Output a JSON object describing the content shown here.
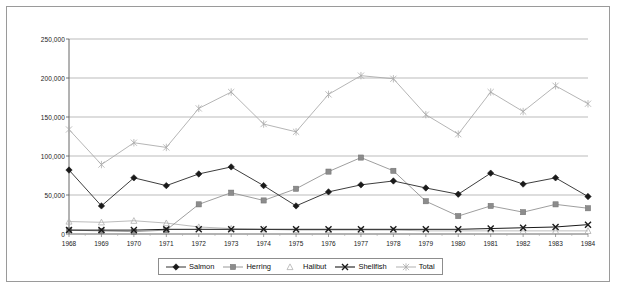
{
  "chart_data": {
    "type": "line",
    "title": "",
    "xlabel": "",
    "ylabel": "",
    "grid": true,
    "legend_position": "bottom",
    "ylim": [
      0,
      250000
    ],
    "ytick_labels": [
      "250,000",
      "200,000",
      "150,000",
      "100,000",
      "50,000",
      "0"
    ],
    "yticks": [
      250000,
      200000,
      150000,
      100000,
      50000,
      0
    ],
    "categories": [
      "1968",
      "1969",
      "1970",
      "1971",
      "1972",
      "1973",
      "1974",
      "1975",
      "1976",
      "1977",
      "1978",
      "1979",
      "1980",
      "1981",
      "1982",
      "1983",
      "1984"
    ],
    "x": [
      1968,
      1969,
      1970,
      1971,
      1972,
      1973,
      1974,
      1975,
      1976,
      1977,
      1978,
      1979,
      1980,
      1981,
      1982,
      1983,
      1984
    ],
    "series": [
      {
        "name": "Salmon",
        "marker": "diamond",
        "color": "#1a1a1a",
        "values": [
          82000,
          36000,
          72000,
          62000,
          77000,
          86000,
          62000,
          36000,
          54000,
          63000,
          68000,
          59000,
          51000,
          78000,
          64000,
          72000,
          48000
        ]
      },
      {
        "name": "Herring",
        "marker": "square",
        "color": "#8c8c8c",
        "values": [
          5000,
          4000,
          3000,
          5000,
          38000,
          53000,
          43000,
          58000,
          80000,
          98000,
          81000,
          42000,
          23000,
          36000,
          28000,
          38000,
          33000
        ]
      },
      {
        "name": "Halibut",
        "marker": "triangle",
        "color": "#b0b0b0",
        "values": [
          16000,
          15000,
          17000,
          14000,
          9000,
          7000,
          6000,
          5000,
          5000,
          5000,
          5000,
          4000,
          4000,
          4000,
          4000,
          4000,
          4000
        ]
      },
      {
        "name": "Shellfish",
        "marker": "cross",
        "color": "#1a1a1a",
        "values": [
          5000,
          5000,
          5000,
          6000,
          6000,
          6000,
          6000,
          6000,
          6000,
          6000,
          6000,
          6000,
          6000,
          7000,
          8000,
          9000,
          12000
        ]
      },
      {
        "name": "Total",
        "marker": "star",
        "color": "#a8a8a8",
        "values": [
          134000,
          89000,
          117000,
          111000,
          161000,
          182000,
          141000,
          131000,
          179000,
          203000,
          199000,
          153000,
          128000,
          182000,
          157000,
          190000,
          167000
        ]
      }
    ]
  },
  "legend": {
    "items": [
      {
        "label": "Salmon"
      },
      {
        "label": "Herring"
      },
      {
        "label": "Halibut"
      },
      {
        "label": "Shellfish"
      },
      {
        "label": "Total"
      }
    ]
  }
}
